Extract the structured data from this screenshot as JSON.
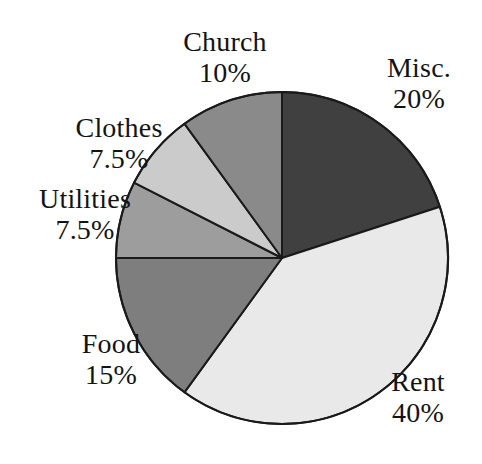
{
  "chart_data": {
    "type": "pie",
    "title": "",
    "subtitle": "",
    "xlabel": "",
    "ylabel": "",
    "legend_position": "none",
    "grid": false,
    "units": "percent",
    "start_angle_deg": 0,
    "direction": "clockwise",
    "categories": [
      "Misc.",
      "Rent",
      "Food",
      "Utilities",
      "Clothes",
      "Church"
    ],
    "values": [
      20,
      40,
      15,
      7.5,
      7.5,
      10
    ],
    "value_labels": [
      "20%",
      "40%",
      "15%",
      "7.5%",
      "7.5%",
      "10%"
    ],
    "colors": [
      "#404040",
      "#e9e9e9",
      "#7e7e7e",
      "#9d9d9d",
      "#cbcbcb",
      "#8a8a8a"
    ],
    "slices": [
      {
        "name": "Misc.",
        "value": 20,
        "value_label": "20%",
        "color": "#404040",
        "start_angle_deg": 0,
        "end_angle_deg": 72
      },
      {
        "name": "Rent",
        "value": 40,
        "value_label": "40%",
        "color": "#e9e9e9",
        "start_angle_deg": 72,
        "end_angle_deg": 216
      },
      {
        "name": "Food",
        "value": 15,
        "value_label": "15%",
        "color": "#7e7e7e",
        "start_angle_deg": 216,
        "end_angle_deg": 270
      },
      {
        "name": "Utilities",
        "value": 7.5,
        "value_label": "7.5%",
        "color": "#9d9d9d",
        "start_angle_deg": 270,
        "end_angle_deg": 297
      },
      {
        "name": "Clothes",
        "value": 7.5,
        "value_label": "7.5%",
        "color": "#cbcbcb",
        "start_angle_deg": 297,
        "end_angle_deg": 324
      },
      {
        "name": "Church",
        "value": 10,
        "value_label": "10%",
        "color": "#8a8a8a",
        "start_angle_deg": 324,
        "end_angle_deg": 360
      }
    ],
    "stroke_color": "#1a1a1a",
    "background_color": "#ffffff"
  },
  "labels": {
    "church": {
      "name": "Church",
      "value": "10%"
    },
    "misc": {
      "name": "Misc.",
      "value": "20%"
    },
    "clothes": {
      "name": "Clothes",
      "value": "7.5%"
    },
    "utilities": {
      "name": "Utilities",
      "value": "7.5%"
    },
    "food": {
      "name": "Food",
      "value": "15%"
    },
    "rent": {
      "name": "Rent",
      "value": "40%"
    }
  }
}
